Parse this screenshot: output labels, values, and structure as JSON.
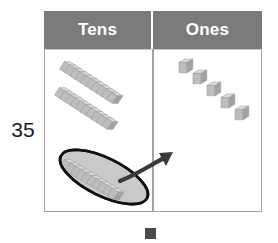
{
  "problem": {
    "number_label": "35",
    "tens_count": 3,
    "ones_count": 5,
    "regrouped_rod_units": 10
  },
  "chart": {
    "columns": [
      {
        "key": "tens",
        "label": "Tens"
      },
      {
        "key": "ones",
        "label": "Ones"
      }
    ],
    "header_bg": "#7b7b7b",
    "header_text_color": "#ffffff",
    "border_color": "#a3a3a3"
  },
  "manipulatives": {
    "rod_label": "ten-rod",
    "unit_label": "unit-cube",
    "block_fill": "#b9b9b9",
    "block_top_fill": "#d6d6d6",
    "block_side_fill": "#9d9d9d",
    "block_stroke": "#8a8a8a"
  },
  "annotation": {
    "circle_label": "circled ten-rod",
    "circle_stroke": "#111111",
    "arrow_label": "regroup arrow",
    "arrow_color": "#3a3a3a"
  },
  "marker": {
    "label": "bottom square marker",
    "color": "#4a4a4a"
  }
}
